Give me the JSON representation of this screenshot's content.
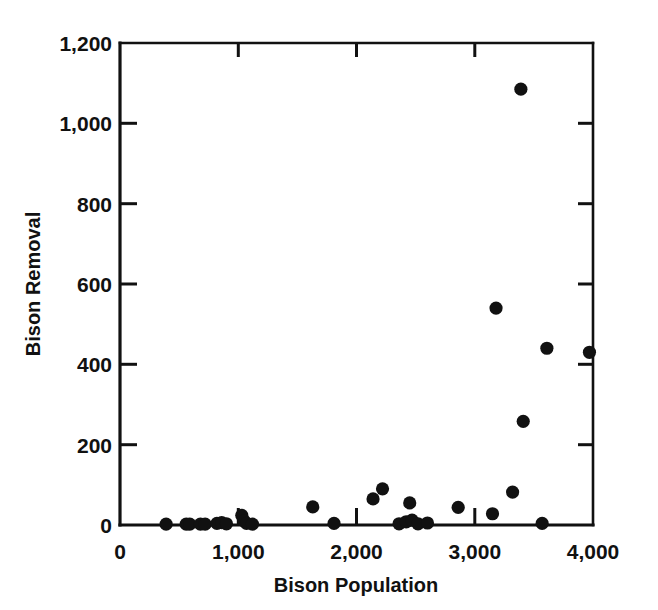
{
  "chart_data": {
    "type": "scatter",
    "title": "",
    "xlabel": "Bison Population",
    "ylabel": "Bison Removal",
    "xlim": [
      0,
      4000
    ],
    "ylim": [
      0,
      1200
    ],
    "xticks": [
      0,
      1000,
      2000,
      3000,
      4000
    ],
    "yticks": [
      0,
      200,
      400,
      600,
      800,
      1000,
      1200
    ],
    "xticklabels": [
      "0",
      "1,000",
      "2,000",
      "3,000",
      "4,000"
    ],
    "yticklabels": [
      "0",
      "200",
      "400",
      "600",
      "800",
      "1,000",
      "1,200"
    ],
    "grid": false,
    "legend": null,
    "marker": "filled-circle",
    "marker_color": "#111111",
    "points": [
      {
        "x": 390,
        "y": 2
      },
      {
        "x": 560,
        "y": 2
      },
      {
        "x": 590,
        "y": 2
      },
      {
        "x": 680,
        "y": 2
      },
      {
        "x": 720,
        "y": 2
      },
      {
        "x": 820,
        "y": 4
      },
      {
        "x": 860,
        "y": 6
      },
      {
        "x": 900,
        "y": 3
      },
      {
        "x": 1030,
        "y": 24
      },
      {
        "x": 1050,
        "y": 10
      },
      {
        "x": 1070,
        "y": 4
      },
      {
        "x": 1120,
        "y": 2
      },
      {
        "x": 1630,
        "y": 45
      },
      {
        "x": 1810,
        "y": 4
      },
      {
        "x": 2140,
        "y": 65
      },
      {
        "x": 2220,
        "y": 90
      },
      {
        "x": 2360,
        "y": 3
      },
      {
        "x": 2420,
        "y": 8
      },
      {
        "x": 2450,
        "y": 55
      },
      {
        "x": 2470,
        "y": 12
      },
      {
        "x": 2520,
        "y": 3
      },
      {
        "x": 2600,
        "y": 5
      },
      {
        "x": 2860,
        "y": 44
      },
      {
        "x": 3150,
        "y": 28
      },
      {
        "x": 3180,
        "y": 540
      },
      {
        "x": 3320,
        "y": 82
      },
      {
        "x": 3390,
        "y": 1085
      },
      {
        "x": 3410,
        "y": 258
      },
      {
        "x": 3570,
        "y": 4
      },
      {
        "x": 3610,
        "y": 440
      },
      {
        "x": 3970,
        "y": 430
      }
    ]
  },
  "axes": {
    "x_title": "Bison Population",
    "y_title": "Bison Removal"
  }
}
